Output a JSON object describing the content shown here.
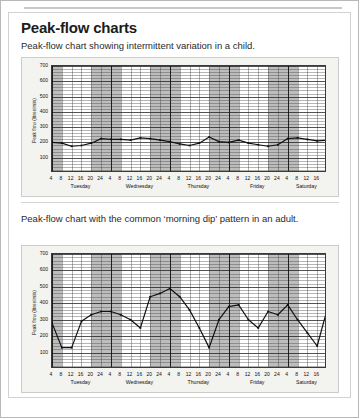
{
  "page": {
    "title": "Peak-flow charts"
  },
  "figures": [
    {
      "caption": "Peak-flow chart showing intermittent variation in a child.",
      "chart_data": {
        "type": "line",
        "title": "Peak-flow chart showing intermittent variation in a child.",
        "xlabel": "",
        "ylabel": "Peak flow (litres/min)",
        "ylim": [
          0,
          700
        ],
        "yticks": [
          100,
          200,
          300,
          400,
          500,
          600,
          700
        ],
        "grid": true,
        "legend": null,
        "days": [
          "Tuesday",
          "Wednesday",
          "Thursday",
          "Friday",
          "Saturday"
        ],
        "xticks": [
          "4",
          "8",
          "12",
          "16",
          "20",
          "24",
          "4",
          "8",
          "12",
          "16",
          "20",
          "24",
          "4",
          "8",
          "12",
          "16",
          "20",
          "24",
          "4",
          "8",
          "12",
          "16",
          "20",
          "24",
          "4",
          "8",
          "12",
          "16"
        ],
        "x": [
          0,
          2,
          4,
          6,
          8,
          10,
          12,
          14,
          16,
          18,
          20,
          22,
          24,
          26,
          28,
          30,
          32,
          34,
          36,
          38,
          40,
          42,
          44,
          46,
          48,
          50,
          52,
          54,
          56
        ],
        "values": [
          200,
          195,
          175,
          180,
          195,
          225,
          220,
          220,
          215,
          230,
          225,
          215,
          205,
          190,
          180,
          195,
          235,
          205,
          200,
          215,
          195,
          185,
          175,
          185,
          225,
          230,
          220,
          210,
          215
        ]
      }
    },
    {
      "caption": "Peak-flow chart with the common ‘morning dip’ pattern in an adult.",
      "chart_data": {
        "type": "line",
        "title": "Peak-flow chart with the common ‘morning dip’ pattern in an adult.",
        "xlabel": "",
        "ylabel": "Peak flow (litres/min)",
        "ylim": [
          0,
          700
        ],
        "yticks": [
          100,
          200,
          300,
          400,
          500,
          600,
          700
        ],
        "grid": true,
        "legend": null,
        "days": [
          "Tuesday",
          "Wednesday",
          "Thursday",
          "Friday",
          "Saturday"
        ],
        "xticks": [
          "4",
          "8",
          "12",
          "16",
          "20",
          "24",
          "4",
          "8",
          "12",
          "16",
          "20",
          "24",
          "4",
          "8",
          "12",
          "16",
          "20",
          "24",
          "4",
          "8",
          "12",
          "16",
          "20",
          "24",
          "4",
          "8",
          "12",
          "16"
        ],
        "x": [
          0,
          2,
          4,
          6,
          8,
          10,
          12,
          14,
          16,
          18,
          20,
          22,
          24,
          26,
          28,
          30,
          32,
          34,
          36,
          38,
          40,
          42,
          44,
          46,
          48,
          50,
          52,
          54,
          56
        ],
        "values": [
          280,
          130,
          130,
          290,
          330,
          350,
          350,
          330,
          300,
          250,
          440,
          460,
          490,
          440,
          360,
          250,
          130,
          300,
          380,
          390,
          300,
          250,
          350,
          330,
          390,
          300,
          220,
          140,
          360
        ]
      }
    }
  ]
}
